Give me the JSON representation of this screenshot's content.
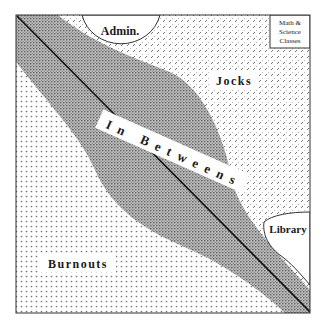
{
  "diagram": {
    "regions": {
      "admin": {
        "label": "Admin."
      },
      "math_science": {
        "label_lines": [
          "Math &",
          "Science",
          "Classes"
        ]
      },
      "jocks": {
        "label": "Jocks"
      },
      "in_betweens": {
        "label": "I n   B e t w e e n s"
      },
      "library": {
        "label": "Library"
      },
      "burnouts": {
        "label": "Burnouts"
      }
    },
    "colors": {
      "background": "#ffffff",
      "frame": "#333333",
      "divider_line": "#111111",
      "pattern_ink": "#555555"
    }
  }
}
